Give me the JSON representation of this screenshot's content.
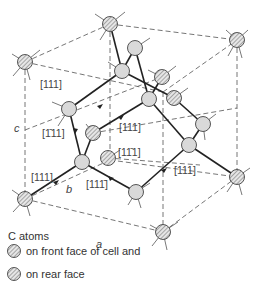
{
  "labels": {
    "dir1": "[111]",
    "dir2": "[1̄11]",
    "dir3": "[111]",
    "dir4": "[11̄1]",
    "dir5": "[111]",
    "dir6": "[111̄]",
    "dir7": "[111]",
    "axis_a": "a",
    "axis_b": "b",
    "axis_c": "c"
  },
  "legend": {
    "title": "C atoms",
    "front": "on front face of cell and",
    "rear": "on rear face"
  },
  "colors": {
    "atom_fill": "#d9d9d9",
    "line": "#222222",
    "dashed": "#666666"
  }
}
